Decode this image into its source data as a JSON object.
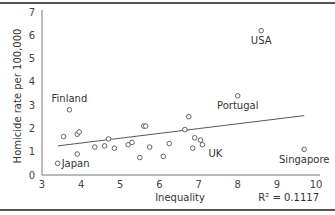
{
  "chart_data": {
    "type": "scatter",
    "title": "",
    "xlabel": "Inequality",
    "ylabel": "Homicide rate per 100,000",
    "xlim": [
      3,
      10
    ],
    "ylim": [
      0,
      7
    ],
    "xticks": [
      3,
      4,
      5,
      6,
      7,
      8,
      9,
      10
    ],
    "yticks": [
      0,
      1,
      2,
      3,
      4,
      5,
      6,
      7
    ],
    "grid": false,
    "annotation": "R² = 0.1117",
    "points": [
      {
        "x": 3.4,
        "y": 0.5,
        "label": "Japan"
      },
      {
        "x": 3.7,
        "y": 2.8,
        "label": "Finland"
      },
      {
        "x": 8.6,
        "y": 6.2,
        "label": "USA"
      },
      {
        "x": 8.0,
        "y": 3.4,
        "label": "Portugal"
      },
      {
        "x": 7.1,
        "y": 1.3,
        "label": "UK"
      },
      {
        "x": 9.7,
        "y": 1.1,
        "label": "Singapore"
      },
      {
        "x": 3.55,
        "y": 1.65,
        "label": ""
      },
      {
        "x": 3.9,
        "y": 1.75,
        "label": ""
      },
      {
        "x": 3.95,
        "y": 1.85,
        "label": ""
      },
      {
        "x": 3.9,
        "y": 0.9,
        "label": ""
      },
      {
        "x": 4.35,
        "y": 1.2,
        "label": ""
      },
      {
        "x": 4.6,
        "y": 1.25,
        "label": ""
      },
      {
        "x": 4.7,
        "y": 1.55,
        "label": ""
      },
      {
        "x": 4.85,
        "y": 1.15,
        "label": ""
      },
      {
        "x": 5.2,
        "y": 1.3,
        "label": ""
      },
      {
        "x": 5.3,
        "y": 1.4,
        "label": ""
      },
      {
        "x": 5.5,
        "y": 0.75,
        "label": ""
      },
      {
        "x": 5.6,
        "y": 2.1,
        "label": ""
      },
      {
        "x": 5.65,
        "y": 2.1,
        "label": ""
      },
      {
        "x": 5.75,
        "y": 1.2,
        "label": ""
      },
      {
        "x": 6.1,
        "y": 0.8,
        "label": ""
      },
      {
        "x": 6.25,
        "y": 1.35,
        "label": ""
      },
      {
        "x": 6.65,
        "y": 1.95,
        "label": ""
      },
      {
        "x": 6.75,
        "y": 2.5,
        "label": ""
      },
      {
        "x": 6.85,
        "y": 1.15,
        "label": ""
      },
      {
        "x": 6.9,
        "y": 1.6,
        "label": ""
      },
      {
        "x": 7.05,
        "y": 1.5,
        "label": ""
      }
    ],
    "trendline": {
      "x": [
        3.4,
        9.7
      ],
      "y": [
        1.25,
        2.55
      ]
    }
  }
}
